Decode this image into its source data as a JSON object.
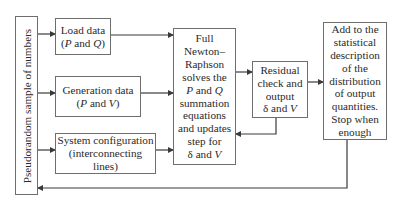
{
  "diagram": {
    "nodes": {
      "pseudorandom": {
        "label": "Pseudorandom sample of  numbers"
      },
      "load": {
        "lines": [
          "Load data",
          "(P and Q)"
        ]
      },
      "generation": {
        "lines": [
          "Generation data",
          "(P and V)"
        ]
      },
      "system": {
        "lines": [
          "System configuration",
          "(interconnecting lines)"
        ]
      },
      "newton": {
        "lines": [
          "Full",
          "Newton–",
          "Raphson",
          "solves the",
          "P and Q",
          "summation",
          "equations",
          "and updates",
          "step for",
          "δ and V"
        ]
      },
      "residual": {
        "lines": [
          "Residual",
          "check and",
          "output",
          "δ and V"
        ]
      },
      "statistics": {
        "lines": [
          "Add to the",
          "statistical",
          "description",
          "of the",
          "distribution",
          "of output",
          "quantities.",
          "Stop when",
          "enough"
        ]
      }
    },
    "edges": [
      {
        "from": "pseudorandom",
        "to": "load"
      },
      {
        "from": "pseudorandom",
        "to": "generation"
      },
      {
        "from": "pseudorandom",
        "to": "system"
      },
      {
        "from": "load",
        "to": "newton"
      },
      {
        "from": "generation",
        "to": "newton"
      },
      {
        "from": "system",
        "to": "newton"
      },
      {
        "from": "newton",
        "to": "residual"
      },
      {
        "from": "residual",
        "to": "newton"
      },
      {
        "from": "residual",
        "to": "statistics"
      },
      {
        "from": "statistics",
        "to": "pseudorandom"
      }
    ],
    "colors": {
      "line": "#3a3a3a",
      "border": "#6e6e6e",
      "text": "#2a2a2a"
    }
  }
}
